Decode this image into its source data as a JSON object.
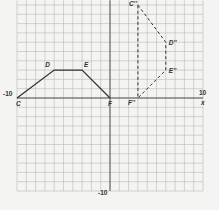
{
  "diagram": {
    "type": "coordinate-grid-transformation",
    "axes": {
      "x_label": "x",
      "x_min_label": "-10",
      "x_max_label": "10",
      "y_min_label": "-10",
      "range": [
        -10,
        10
      ]
    },
    "original_figure": {
      "style": "solid",
      "vertices": [
        {
          "name": "C",
          "x": -10,
          "y": 0
        },
        {
          "name": "D",
          "x": -6,
          "y": 3
        },
        {
          "name": "E",
          "x": -3,
          "y": 3
        },
        {
          "name": "F",
          "x": 0,
          "y": 0
        }
      ]
    },
    "image_figure": {
      "style": "dashed",
      "vertices": [
        {
          "name": "C''",
          "x": 3,
          "y": 10
        },
        {
          "name": "D''",
          "x": 6,
          "y": 6
        },
        {
          "name": "E''",
          "x": 6,
          "y": 3
        },
        {
          "name": "F''",
          "x": 3,
          "y": 0
        }
      ]
    },
    "colors": {
      "grid": "#b8b8b8",
      "axis": "#555555",
      "figure": "#333333",
      "background": "#f4f4f2"
    }
  }
}
